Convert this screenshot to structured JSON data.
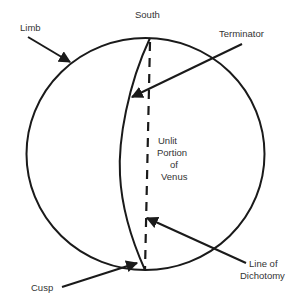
{
  "diagram": {
    "labels": {
      "south": "South",
      "limb": "Limb",
      "terminator": "Terminator",
      "unlit": [
        "Unlit",
        "Portion",
        "of",
        "Venus"
      ],
      "line_of_dichotomy": [
        "Line of",
        "Dichotomy"
      ],
      "cusp": "Cusp"
    },
    "colors": {
      "stroke": "#1a1a1a",
      "text": "#333333",
      "background": "#ffffff"
    }
  }
}
